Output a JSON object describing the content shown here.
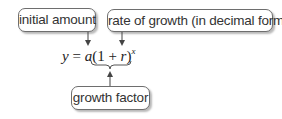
{
  "labels": {
    "initial_amount": "initial amount",
    "rate_of_growth": "rate of growth (in decimal form)",
    "growth_factor": "growth factor"
  },
  "equation": {
    "lhs": "y",
    "equals": " = ",
    "a": "a",
    "open": "(1 + ",
    "r": "r",
    "close": ")",
    "exponent": "x"
  },
  "colors": {
    "box_border": "#6e6e6e",
    "text": "#333333",
    "arrow": "#444444"
  }
}
